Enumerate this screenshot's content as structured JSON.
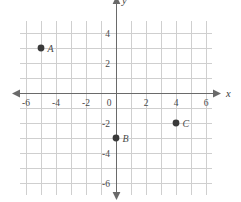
{
  "chart_data": {
    "type": "scatter",
    "title": "",
    "xlabel": "x",
    "ylabel": "y",
    "xlim": [
      -6.4,
      6.4
    ],
    "ylim": [
      -6.8,
      4.8
    ],
    "grid": true,
    "grid_step": 1,
    "legend": "none",
    "x_ticks": [
      -6,
      -4,
      -2,
      0,
      2,
      4,
      6
    ],
    "y_ticks": [
      4,
      2,
      -2,
      -4,
      -6
    ],
    "x_tick_labels": [
      "-6",
      "-4",
      "-2",
      "0",
      "2",
      "4",
      "6"
    ],
    "y_tick_labels": [
      "4",
      "2",
      "-2",
      "-4",
      "-6"
    ],
    "points": [
      {
        "label": "A",
        "x": -5,
        "y": 3
      },
      {
        "label": "B",
        "x": 0,
        "y": -3
      },
      {
        "label": "C",
        "x": 4,
        "y": -2
      }
    ],
    "origin_label": "0"
  },
  "axes": {
    "x_name": "x",
    "y_name": "y"
  },
  "colors": {
    "grid": "#cfcfcf",
    "axis": "#6a6a6a",
    "point": "#3a3a3a",
    "text": "#4a4a4a",
    "background": "#ffffff"
  }
}
